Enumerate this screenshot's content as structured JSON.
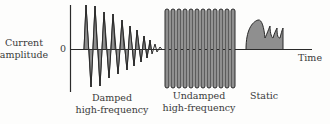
{
  "diagram": {
    "ylabel_line1": "Current",
    "ylabel_line2": "amplitude",
    "zero_label": "0",
    "xlabel": "Time",
    "colors": {
      "stroke": "#2a2a2a",
      "fill": "#8f8f8f",
      "text": "#3a3a3a"
    },
    "sections": [
      {
        "name": "damped",
        "label_line1": "Damped",
        "label_line2": "high-frequency"
      },
      {
        "name": "undamped",
        "label_line1": "Undamped",
        "label_line2": "high-frequency"
      },
      {
        "name": "static",
        "label_line1": "Static",
        "label_line2": ""
      }
    ]
  }
}
